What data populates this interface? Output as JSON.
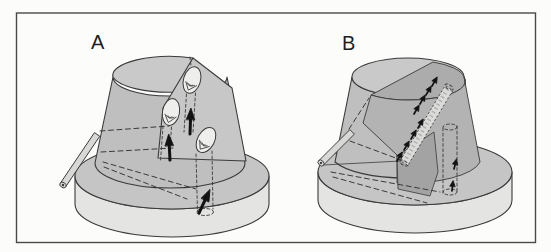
{
  "figure": {
    "panel_a": {
      "label": "A"
    },
    "panel_b": {
      "label": "B"
    }
  },
  "colors": {
    "ink": "#3a3a3a",
    "frame": "#4a4a4a",
    "rule": "#1f1f1f",
    "flank": "#bfbfbf",
    "summit": "#c9c9c9",
    "facet": "#c7c7c7",
    "disk-top": "#c5c5c5",
    "disk-side": "#e4e4e3",
    "dark-lens": "#acacac",
    "dark-sector": "#b3b3b3",
    "dark-block": "#a3a3a3",
    "band": "#dbdbda",
    "egg": "#eeeeec",
    "rod": "#d8d8d7",
    "arrow": "#121212"
  }
}
